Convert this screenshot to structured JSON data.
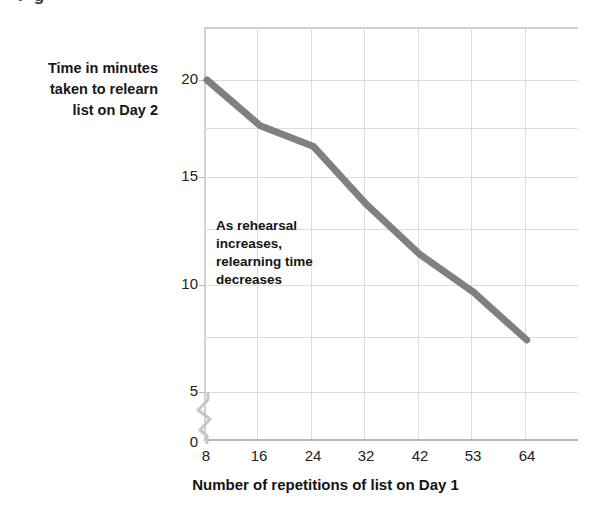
{
  "page": {
    "bleed_text_top": "I                                         g"
  },
  "figure": {
    "y_axis_title_lines": [
      "Time in minutes",
      "taken to relearn",
      "list on Day 2"
    ],
    "y_axis_title": "Time in minutes taken to relearn list on Day 2",
    "x_axis_title": "Number of repetitions of list on Day 1",
    "annotation_lines": [
      "As rehearsal",
      "increases,",
      "relearning time",
      "decreases"
    ],
    "annotation": "As rehearsal increases, relearning time decreases",
    "axis_break_marker": "zigzag-axis-break",
    "colors": {
      "line": "#808080",
      "grid": "#dddddd",
      "frame": "#cfcfcf",
      "text": "#161616"
    }
  },
  "chart_data": {
    "type": "line",
    "title": "",
    "subtitle": "",
    "xlabel": "Number of repetitions of list on Day 1",
    "ylabel": "Time in minutes taken to relearn list on Day 2",
    "categories": [
      "8",
      "16",
      "24",
      "32",
      "42",
      "53",
      "64"
    ],
    "x": [
      8,
      16,
      24,
      32,
      42,
      53,
      64
    ],
    "values": [
      20.0,
      17.8,
      16.8,
      14.0,
      11.6,
      9.8,
      7.5
    ],
    "series": [
      {
        "name": "Relearning time",
        "values": [
          20.0,
          17.8,
          16.8,
          14.0,
          11.6,
          9.8,
          7.5
        ]
      }
    ],
    "xtick_labels": [
      "8",
      "16",
      "24",
      "32",
      "42",
      "53",
      "64"
    ],
    "ytick_labels": [
      "0",
      "5",
      "10",
      "15",
      "20"
    ],
    "ytick_values": [
      0,
      5,
      10,
      15,
      20
    ],
    "ylim": [
      0,
      22.3
    ],
    "axis_break": {
      "between": [
        0,
        5
      ],
      "axis": "y"
    },
    "grid": true,
    "legend": false,
    "legend_position": "none",
    "annotations": [
      {
        "text": "As rehearsal increases, relearning time decreases",
        "x": 24,
        "y": 12.8
      }
    ]
  }
}
